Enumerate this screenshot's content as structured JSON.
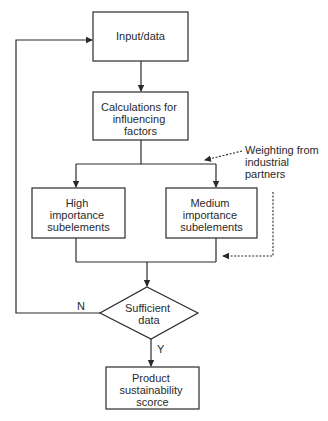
{
  "diagram": {
    "type": "flowchart",
    "nodes": {
      "input": {
        "lines": [
          "Input/data"
        ]
      },
      "calc": {
        "lines": [
          "Calculations for",
          "influencing",
          "factors"
        ]
      },
      "high": {
        "lines": [
          "High",
          "importance",
          "subelements"
        ]
      },
      "medium": {
        "lines": [
          "Medium",
          "importance",
          "subelements"
        ]
      },
      "decision": {
        "lines": [
          "Sufficient",
          "data"
        ]
      },
      "output": {
        "lines": [
          "Product",
          "sustainability",
          "scorce"
        ]
      }
    },
    "annotation": {
      "lines": [
        "Weighting from",
        "industrial",
        "partners"
      ]
    },
    "edge_labels": {
      "no": "N",
      "yes": "Y"
    },
    "edges": [
      {
        "from": "input",
        "to": "calc"
      },
      {
        "from": "calc",
        "to": "high"
      },
      {
        "from": "calc",
        "to": "medium"
      },
      {
        "from": "high",
        "to": "decision"
      },
      {
        "from": "medium",
        "to": "decision"
      },
      {
        "from": "decision",
        "to": "output",
        "label": "Y"
      },
      {
        "from": "decision",
        "to": "input",
        "label": "N"
      },
      {
        "from": "annotation",
        "to": "branch",
        "style": "dotted"
      },
      {
        "from": "annotation",
        "to": "merge",
        "style": "dotted"
      }
    ]
  }
}
